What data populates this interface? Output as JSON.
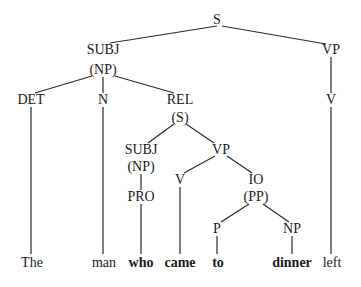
{
  "nodes": {
    "s": {
      "label": "S",
      "x": 217,
      "y": 20
    },
    "subj": {
      "label": "SUBJ",
      "x": 103,
      "y": 50
    },
    "subj_np": {
      "label": "(NP)",
      "x": 103,
      "y": 70
    },
    "vp": {
      "label": "VP",
      "x": 331,
      "y": 50
    },
    "det": {
      "label": "DET",
      "x": 31,
      "y": 100
    },
    "n": {
      "label": "N",
      "x": 103,
      "y": 100
    },
    "rel": {
      "label": "REL",
      "x": 180,
      "y": 100
    },
    "rel_s": {
      "label": "(S)",
      "x": 180,
      "y": 118
    },
    "v_main": {
      "label": "V",
      "x": 331,
      "y": 100
    },
    "subj2": {
      "label": "SUBJ",
      "x": 141,
      "y": 150
    },
    "subj2_np": {
      "label": "(NP)",
      "x": 141,
      "y": 167
    },
    "vp2": {
      "label": "VP",
      "x": 221,
      "y": 150
    },
    "pro": {
      "label": "PRO",
      "x": 141,
      "y": 197
    },
    "v2": {
      "label": "V",
      "x": 180,
      "y": 180
    },
    "io": {
      "label": "IO",
      "x": 256,
      "y": 180
    },
    "io_pp": {
      "label": "(PP)",
      "x": 256,
      "y": 197
    },
    "p": {
      "label": "P",
      "x": 217,
      "y": 229
    },
    "np3": {
      "label": "NP",
      "x": 292,
      "y": 229
    }
  },
  "words": [
    {
      "text": "The",
      "x": 32,
      "y": 263,
      "bold": false
    },
    {
      "text": "man",
      "x": 104,
      "y": 263,
      "bold": false
    },
    {
      "text": "who",
      "x": 141,
      "y": 263,
      "bold": true
    },
    {
      "text": "came",
      "x": 180,
      "y": 263,
      "bold": true
    },
    {
      "text": "to",
      "x": 218,
      "y": 263,
      "bold": true
    },
    {
      "text": "dinner",
      "x": 292,
      "y": 263,
      "bold": true
    },
    {
      "text": "left",
      "x": 332,
      "y": 263,
      "bold": false
    }
  ],
  "edges": [
    [
      217,
      26,
      110,
      43
    ],
    [
      222,
      26,
      326,
      44
    ],
    [
      92,
      76,
      35,
      93
    ],
    [
      103,
      77,
      103,
      93
    ],
    [
      115,
      76,
      174,
      93
    ],
    [
      331,
      57,
      331,
      93
    ],
    [
      31,
      107,
      31,
      254
    ],
    [
      103,
      107,
      103,
      254
    ],
    [
      331,
      107,
      331,
      254
    ],
    [
      174,
      124,
      148,
      143
    ],
    [
      186,
      124,
      214,
      143
    ],
    [
      141,
      174,
      141,
      190
    ],
    [
      141,
      204,
      141,
      254
    ],
    [
      215,
      156,
      184,
      173
    ],
    [
      227,
      156,
      252,
      173
    ],
    [
      180,
      187,
      180,
      254
    ],
    [
      249,
      204,
      221,
      222
    ],
    [
      263,
      204,
      289,
      222
    ],
    [
      217,
      236,
      217,
      254
    ],
    [
      292,
      236,
      292,
      254
    ]
  ]
}
